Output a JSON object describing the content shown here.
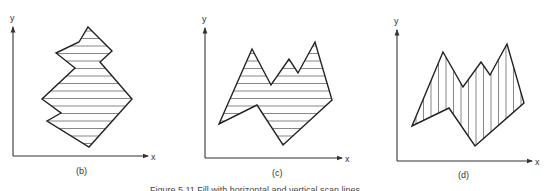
{
  "figure": {
    "caption": "Figure 5.11   Fill with horizontal and vertical scan lines",
    "colors": {
      "stroke": "#222222",
      "hatch": "#555555",
      "background": "#ffffff"
    },
    "panels": [
      {
        "id": "b",
        "label": "(b)",
        "x_axis_label": "x",
        "y_axis_label": "y",
        "hatch_direction": "horizontal",
        "polygon": [
          [
            88,
            27
          ],
          [
            112,
            51
          ],
          [
            100,
            62
          ],
          [
            132,
            99
          ],
          [
            89,
            147
          ],
          [
            47,
            121
          ],
          [
            61,
            113
          ],
          [
            42,
            99
          ],
          [
            75,
            68
          ],
          [
            56,
            53
          ],
          [
            79,
            42
          ]
        ]
      },
      {
        "id": "c",
        "label": "(c)",
        "x_axis_label": "x",
        "y_axis_label": "y",
        "hatch_direction": "horizontal",
        "polygon": [
          [
            219,
            124
          ],
          [
            252,
            49
          ],
          [
            271,
            85
          ],
          [
            289,
            59
          ],
          [
            298,
            73
          ],
          [
            315,
            42
          ],
          [
            332,
            100
          ],
          [
            283,
            145
          ],
          [
            257,
            105
          ]
        ]
      },
      {
        "id": "d",
        "label": "(d)",
        "x_axis_label": "x",
        "y_axis_label": "y",
        "hatch_direction": "vertical",
        "polygon": [
          [
            412,
            126
          ],
          [
            443,
            52
          ],
          [
            463,
            87
          ],
          [
            481,
            62
          ],
          [
            490,
            75
          ],
          [
            507,
            44
          ],
          [
            524,
            103
          ],
          [
            475,
            146
          ],
          [
            449,
            108
          ]
        ]
      }
    ]
  }
}
